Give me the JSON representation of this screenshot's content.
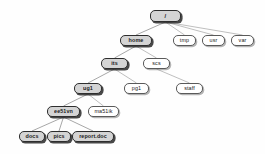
{
  "diagram": {
    "type": "tree",
    "background_color": "#fefefe",
    "node_fill_color": "#ffffff",
    "node_highlight_color": "#d4d4d4",
    "node_border_color": "#5a5a5a",
    "edge_color": "#8a8a8a"
  },
  "nodes": [
    {
      "id": "root",
      "label": "/",
      "x": 150,
      "y": 10,
      "w": 31,
      "h": 12,
      "highlighted": true,
      "level": 0
    },
    {
      "id": "home",
      "label": "home",
      "x": 120,
      "y": 35,
      "w": 32,
      "h": 11,
      "highlighted": true,
      "level": 1
    },
    {
      "id": "tmp",
      "label": "tmp",
      "x": 173,
      "y": 35,
      "w": 23,
      "h": 11,
      "highlighted": false,
      "level": 1
    },
    {
      "id": "usr",
      "label": "usr",
      "x": 202,
      "y": 35,
      "w": 23,
      "h": 11,
      "highlighted": false,
      "level": 1
    },
    {
      "id": "var",
      "label": "var",
      "x": 231,
      "y": 35,
      "w": 23,
      "h": 11,
      "highlighted": false,
      "level": 1
    },
    {
      "id": "its",
      "label": "its",
      "x": 101,
      "y": 58,
      "w": 27,
      "h": 11,
      "highlighted": true,
      "level": 2
    },
    {
      "id": "scs",
      "label": "scs",
      "x": 143,
      "y": 58,
      "w": 27,
      "h": 11,
      "highlighted": false,
      "level": 2
    },
    {
      "id": "ug1",
      "label": "ug1",
      "x": 74,
      "y": 83,
      "w": 28,
      "h": 11,
      "highlighted": true,
      "level": 3
    },
    {
      "id": "pg1",
      "label": "pg1",
      "x": 124,
      "y": 83,
      "w": 25,
      "h": 11,
      "highlighted": false,
      "level": 3
    },
    {
      "id": "staff",
      "label": "staff",
      "x": 176,
      "y": 83,
      "w": 27,
      "h": 11,
      "highlighted": false,
      "level": 3
    },
    {
      "id": "ee51vn",
      "label": "ee51vn",
      "x": 47,
      "y": 106,
      "w": 33,
      "h": 11,
      "highlighted": true,
      "level": 4
    },
    {
      "id": "ma51ik",
      "label": "ma51ik",
      "x": 88,
      "y": 106,
      "w": 31,
      "h": 11,
      "highlighted": false,
      "level": 4
    },
    {
      "id": "docs",
      "label": "docs",
      "x": 19,
      "y": 131,
      "w": 26,
      "h": 11,
      "highlighted": true,
      "level": 5
    },
    {
      "id": "pics",
      "label": "pics",
      "x": 47,
      "y": 131,
      "w": 24,
      "h": 11,
      "highlighted": true,
      "level": 5
    },
    {
      "id": "report",
      "label": "report.doc",
      "x": 72,
      "y": 131,
      "w": 42,
      "h": 11,
      "highlighted": true,
      "level": 5
    }
  ],
  "edges": [
    {
      "from": "root",
      "to": "home",
      "highlighted": true
    },
    {
      "from": "root",
      "to": "tmp",
      "highlighted": false
    },
    {
      "from": "root",
      "to": "usr",
      "highlighted": false
    },
    {
      "from": "root",
      "to": "var",
      "highlighted": false
    },
    {
      "from": "home",
      "to": "its",
      "highlighted": true
    },
    {
      "from": "home",
      "to": "scs",
      "highlighted": false
    },
    {
      "from": "its",
      "to": "ug1",
      "highlighted": true
    },
    {
      "from": "its",
      "to": "pg1",
      "highlighted": false
    },
    {
      "from": "scs",
      "to": "staff",
      "highlighted": false
    },
    {
      "from": "ug1",
      "to": "ee51vn",
      "highlighted": true
    },
    {
      "from": "ug1",
      "to": "ma51ik",
      "highlighted": false
    },
    {
      "from": "ee51vn",
      "to": "docs",
      "highlighted": true
    },
    {
      "from": "ee51vn",
      "to": "pics",
      "highlighted": true
    },
    {
      "from": "ee51vn",
      "to": "report",
      "highlighted": true
    }
  ]
}
